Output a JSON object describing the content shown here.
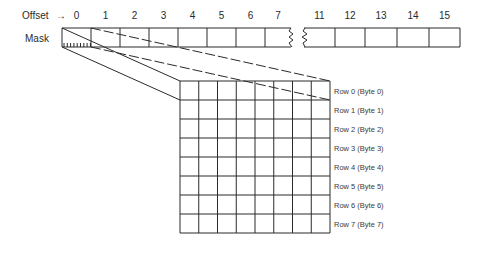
{
  "labels": {
    "offset": "Offset",
    "arrow": "→",
    "mask": "Mask"
  },
  "offset_cells": {
    "left": [
      "0",
      "1",
      "2",
      "3",
      "4",
      "5",
      "6",
      "7"
    ],
    "right": [
      "11",
      "12",
      "13",
      "14",
      "15"
    ]
  },
  "grid": {
    "columns": 8,
    "rows": [
      "Row 0 (Byte 0)",
      "Row 1 (Byte 1)",
      "Row 2 (Byte 2)",
      "Row 3 (Byte 3)",
      "Row 4 (Byte 4)",
      "Row 5 (Byte 5)",
      "Row 6 (Byte 6)",
      "Row 7 (Byte 7)"
    ]
  }
}
